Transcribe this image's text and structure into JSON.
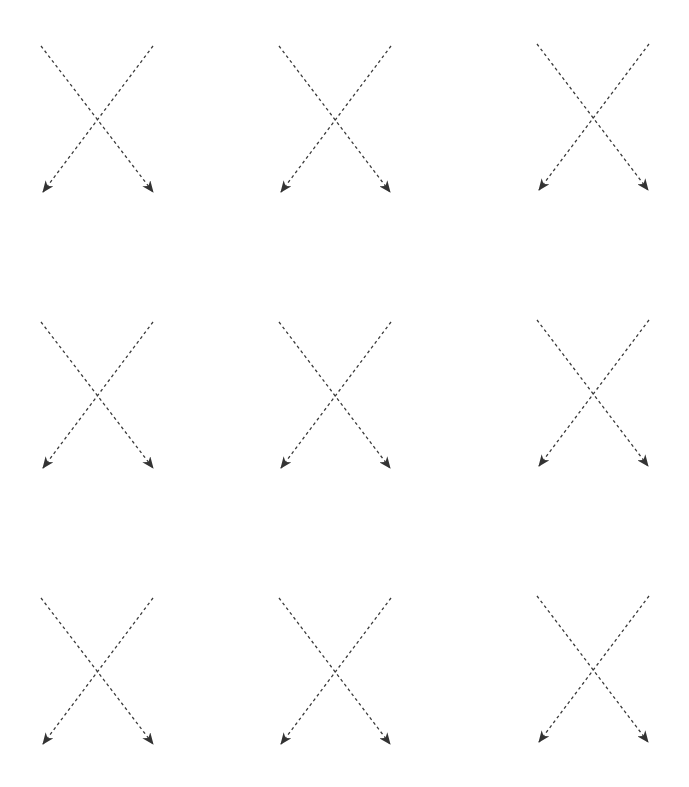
{
  "diagram": {
    "title": "",
    "background": "#ffffff",
    "stroke_color": "#3a3a3a",
    "arrowhead_color": "#333333",
    "dash_pattern": "3,3",
    "arrowhead_style": "stealth",
    "grid": {
      "rows": 3,
      "cols": 3
    },
    "figures": [
      {
        "id": "x-r1c1",
        "row": 1,
        "col": 1,
        "arrows": [
          {
            "from": [
              41,
              46
            ],
            "to": [
              153,
              192
            ],
            "direction": "down-right"
          },
          {
            "from": [
              153,
              46
            ],
            "to": [
              43,
              192
            ],
            "direction": "down-left"
          }
        ]
      },
      {
        "id": "x-r1c2",
        "row": 1,
        "col": 2,
        "arrows": [
          {
            "from": [
              279,
              46
            ],
            "to": [
              390,
              192
            ],
            "direction": "down-right"
          },
          {
            "from": [
              391,
              46
            ],
            "to": [
              281,
              192
            ],
            "direction": "down-left"
          }
        ]
      },
      {
        "id": "x-r1c3",
        "row": 1,
        "col": 3,
        "arrows": [
          {
            "from": [
              537,
              44
            ],
            "to": [
              648,
              190
            ],
            "direction": "down-right"
          },
          {
            "from": [
              649,
              44
            ],
            "to": [
              539,
              190
            ],
            "direction": "down-left"
          }
        ]
      },
      {
        "id": "x-r2c1",
        "row": 2,
        "col": 1,
        "arrows": [
          {
            "from": [
              41,
              322
            ],
            "to": [
              153,
              468
            ],
            "direction": "down-right"
          },
          {
            "from": [
              153,
              322
            ],
            "to": [
              43,
              468
            ],
            "direction": "down-left"
          }
        ]
      },
      {
        "id": "x-r2c2",
        "row": 2,
        "col": 2,
        "arrows": [
          {
            "from": [
              279,
              322
            ],
            "to": [
              390,
              468
            ],
            "direction": "down-right"
          },
          {
            "from": [
              391,
              322
            ],
            "to": [
              281,
              468
            ],
            "direction": "down-left"
          }
        ]
      },
      {
        "id": "x-r2c3",
        "row": 2,
        "col": 3,
        "arrows": [
          {
            "from": [
              537,
              320
            ],
            "to": [
              648,
              466
            ],
            "direction": "down-right"
          },
          {
            "from": [
              649,
              320
            ],
            "to": [
              539,
              466
            ],
            "direction": "down-left"
          }
        ]
      },
      {
        "id": "x-r3c1",
        "row": 3,
        "col": 1,
        "arrows": [
          {
            "from": [
              41,
              598
            ],
            "to": [
              153,
              744
            ],
            "direction": "down-right"
          },
          {
            "from": [
              153,
              598
            ],
            "to": [
              43,
              744
            ],
            "direction": "down-left"
          }
        ]
      },
      {
        "id": "x-r3c2",
        "row": 3,
        "col": 2,
        "arrows": [
          {
            "from": [
              279,
              598
            ],
            "to": [
              390,
              744
            ],
            "direction": "down-right"
          },
          {
            "from": [
              391,
              598
            ],
            "to": [
              281,
              744
            ],
            "direction": "down-left"
          }
        ]
      },
      {
        "id": "x-r3c3",
        "row": 3,
        "col": 3,
        "arrows": [
          {
            "from": [
              537,
              596
            ],
            "to": [
              648,
              742
            ],
            "direction": "down-right"
          },
          {
            "from": [
              649,
              596
            ],
            "to": [
              539,
              742
            ],
            "direction": "down-left"
          }
        ]
      }
    ]
  }
}
